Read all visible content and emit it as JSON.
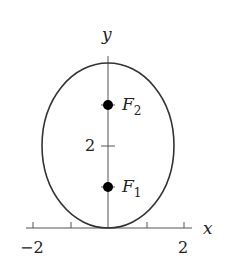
{
  "diagram": {
    "type": "ellipse-with-foci",
    "axes": {
      "x_label": "x",
      "y_label": "y",
      "x_tick_labels": [
        "-2",
        "2"
      ],
      "y_tick_labels": [
        "2"
      ]
    },
    "foci": [
      {
        "label": "F",
        "subscript": "1"
      },
      {
        "label": "F",
        "subscript": "2"
      }
    ],
    "colors": {
      "curve": "#333333",
      "axes": "#555555",
      "points": "#000000"
    }
  }
}
